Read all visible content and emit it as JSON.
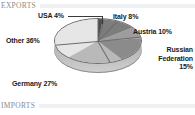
{
  "sections": {
    "exports": {
      "label": "EXPORTS"
    },
    "imports": {
      "label": "IMPORTS"
    }
  },
  "chart_data": {
    "type": "pie",
    "title": "EXPORTS",
    "categories": [
      "USA",
      "Italy",
      "Austria",
      "Russian Federation",
      "Germany",
      "Other"
    ],
    "values": [
      4,
      8,
      10,
      15,
      27,
      36
    ],
    "unit": "%",
    "labels": [
      "USA 4%",
      "Italy 8%",
      "Austria 10%",
      "Russian Federation 15%",
      "Germany 27%",
      "Other 36%"
    ],
    "slice_colors": [
      "#4f4f4f",
      "#7d7d7d",
      "#9d9d9d",
      "#8b8b8b",
      "#b9b9b9",
      "#e6e6e6"
    ],
    "legend": "none",
    "data_labels": "outside-with-leader",
    "style": "3d-pie-grayscale",
    "background": "#ffffff"
  },
  "labels": {
    "usa": "USA 4%",
    "italy": "Italy 8%",
    "austria": "Austria 10%",
    "russia": "Russian Federation 15%",
    "germany": "Germany 27%",
    "other": "Other 36%"
  }
}
